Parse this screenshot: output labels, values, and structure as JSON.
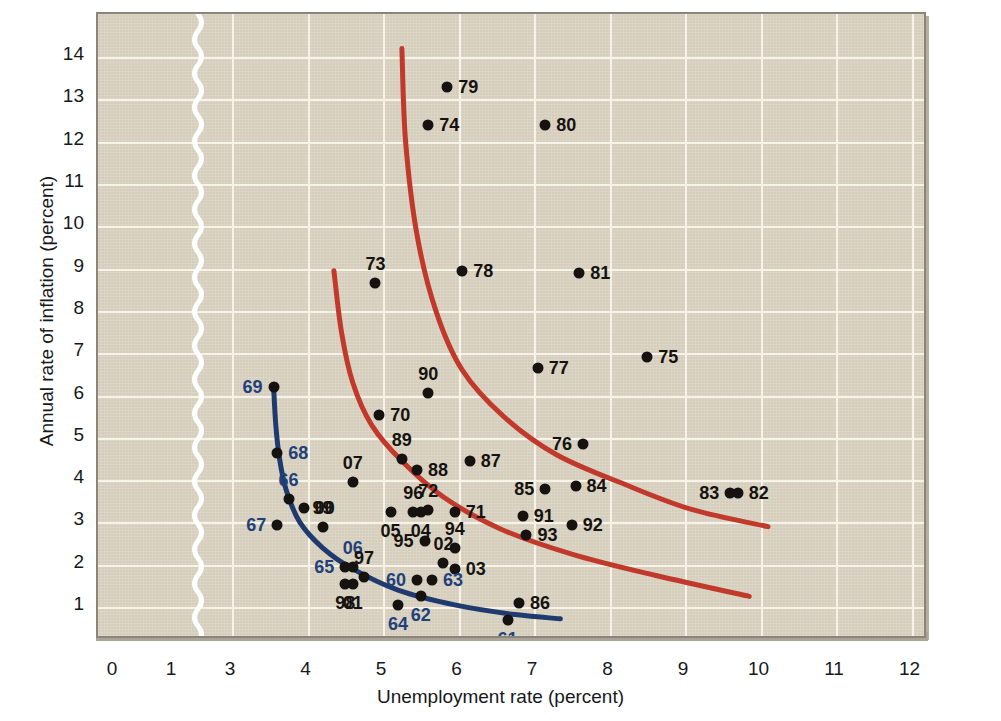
{
  "chart_data": {
    "type": "scatter",
    "title": "",
    "xlabel": "Unemployment rate (percent)",
    "ylabel": "Annual rate of inflation (percent)",
    "xlim": [
      0,
      12.5
    ],
    "ylim": [
      0,
      14.6
    ],
    "x_ticks": [
      "0",
      "1",
      "3",
      "4",
      "5",
      "6",
      "7",
      "8",
      "9",
      "10",
      "11",
      "12"
    ],
    "y_ticks": [
      "1",
      "2",
      "3",
      "4",
      "5",
      "6",
      "7",
      "8",
      "9",
      "10",
      "11",
      "12",
      "13",
      "14"
    ],
    "axis_break": {
      "between": [
        "1",
        "3"
      ],
      "style": "zigzag",
      "color": "#ffffff"
    },
    "grid": true,
    "legend": "none",
    "point_label_format": "two-digit year",
    "points": [
      {
        "label": "79",
        "x": 5.85,
        "y": 13.3,
        "label_pos": "right",
        "label_color": "black"
      },
      {
        "label": "74",
        "x": 5.6,
        "y": 12.4,
        "label_pos": "right",
        "label_color": "black"
      },
      {
        "label": "80",
        "x": 7.15,
        "y": 12.4,
        "label_pos": "right",
        "label_color": "black"
      },
      {
        "label": "73",
        "x": 4.9,
        "y": 8.65,
        "label_pos": "above",
        "label_color": "black"
      },
      {
        "label": "78",
        "x": 6.05,
        "y": 8.95,
        "label_pos": "right",
        "label_color": "black"
      },
      {
        "label": "81",
        "x": 7.6,
        "y": 8.9,
        "label_pos": "right",
        "label_color": "black"
      },
      {
        "label": "77",
        "x": 7.05,
        "y": 6.65,
        "label_pos": "right",
        "label_color": "black"
      },
      {
        "label": "75",
        "x": 8.5,
        "y": 6.9,
        "label_pos": "right",
        "label_color": "black"
      },
      {
        "label": "69",
        "x": 3.55,
        "y": 6.2,
        "label_pos": "left",
        "label_color": "blue"
      },
      {
        "label": "90",
        "x": 5.6,
        "y": 6.05,
        "label_pos": "above",
        "label_color": "black"
      },
      {
        "label": "70",
        "x": 4.95,
        "y": 5.55,
        "label_pos": "right",
        "label_color": "black"
      },
      {
        "label": "68",
        "x": 3.6,
        "y": 4.65,
        "label_pos": "right",
        "label_color": "blue"
      },
      {
        "label": "89",
        "x": 5.25,
        "y": 4.5,
        "label_pos": "above",
        "label_color": "black"
      },
      {
        "label": "76",
        "x": 7.65,
        "y": 4.85,
        "label_pos": "left",
        "label_color": "black"
      },
      {
        "label": "88",
        "x": 5.45,
        "y": 4.25,
        "label_pos": "right",
        "label_color": "black"
      },
      {
        "label": "87",
        "x": 6.15,
        "y": 4.45,
        "label_pos": "right",
        "label_color": "black"
      },
      {
        "label": "07",
        "x": 4.6,
        "y": 3.95,
        "label_pos": "above",
        "label_color": "black"
      },
      {
        "label": "66",
        "x": 3.75,
        "y": 3.55,
        "label_pos": "above",
        "label_color": "blue"
      },
      {
        "label": "85",
        "x": 7.15,
        "y": 3.8,
        "label_pos": "left",
        "label_color": "black"
      },
      {
        "label": "84",
        "x": 7.55,
        "y": 3.85,
        "label_pos": "right",
        "label_color": "black"
      },
      {
        "label": "83",
        "x": 9.6,
        "y": 3.7,
        "label_pos": "left",
        "label_color": "black"
      },
      {
        "label": "82",
        "x": 9.7,
        "y": 3.7,
        "label_pos": "right",
        "label_color": "black"
      },
      {
        "label": "00",
        "x": 3.95,
        "y": 3.35,
        "label_pos": "right",
        "label_color": "black"
      },
      {
        "label": "96",
        "x": 5.4,
        "y": 3.25,
        "label_pos": "above",
        "label_color": "black"
      },
      {
        "label": "72",
        "x": 5.6,
        "y": 3.3,
        "label_pos": "above",
        "label_color": "black"
      },
      {
        "label": "71",
        "x": 5.95,
        "y": 3.25,
        "label_pos": "right",
        "label_color": "black"
      },
      {
        "label": "91",
        "x": 6.85,
        "y": 3.15,
        "label_pos": "right",
        "label_color": "black"
      },
      {
        "label": "92",
        "x": 7.5,
        "y": 2.95,
        "label_pos": "right",
        "label_color": "black"
      },
      {
        "label": "99",
        "x": 4.2,
        "y": 2.9,
        "label_pos": "above",
        "label_color": "black"
      },
      {
        "label": "67",
        "x": 3.6,
        "y": 2.95,
        "label_pos": "left",
        "label_color": "blue"
      },
      {
        "label": "05",
        "x": 5.1,
        "y": 3.25,
        "label_pos": "below",
        "label_color": "black"
      },
      {
        "label": "04",
        "x": 5.5,
        "y": 3.25,
        "label_pos": "below",
        "label_color": "black"
      },
      {
        "label": "93",
        "x": 6.9,
        "y": 2.7,
        "label_pos": "right",
        "label_color": "black"
      },
      {
        "label": "95",
        "x": 5.55,
        "y": 2.55,
        "label_pos": "left",
        "label_color": "black"
      },
      {
        "label": "94",
        "x": 5.95,
        "y": 2.4,
        "label_pos": "above",
        "label_color": "black"
      },
      {
        "label": "02",
        "x": 5.8,
        "y": 2.05,
        "label_pos": "above",
        "label_color": "black"
      },
      {
        "label": "03",
        "x": 5.95,
        "y": 1.9,
        "label_pos": "right",
        "label_color": "black"
      },
      {
        "label": "65",
        "x": 4.5,
        "y": 1.95,
        "label_pos": "left",
        "label_color": "blue"
      },
      {
        "label": "06",
        "x": 4.6,
        "y": 1.95,
        "label_pos": "above",
        "label_color": "blue"
      },
      {
        "label": "97",
        "x": 4.75,
        "y": 1.7,
        "label_pos": "above",
        "label_color": "black"
      },
      {
        "label": "60",
        "x": 5.45,
        "y": 1.65,
        "label_pos": "left",
        "label_color": "blue"
      },
      {
        "label": "63",
        "x": 5.65,
        "y": 1.65,
        "label_pos": "right",
        "label_color": "blue"
      },
      {
        "label": "98",
        "x": 4.5,
        "y": 1.55,
        "label_pos": "below",
        "label_color": "black"
      },
      {
        "label": "01",
        "x": 4.6,
        "y": 1.55,
        "label_pos": "below",
        "label_color": "black"
      },
      {
        "label": "62",
        "x": 5.5,
        "y": 1.25,
        "label_pos": "below",
        "label_color": "blue"
      },
      {
        "label": "64",
        "x": 5.2,
        "y": 1.05,
        "label_pos": "below",
        "label_color": "blue"
      },
      {
        "label": "86",
        "x": 6.8,
        "y": 1.1,
        "label_pos": "right",
        "label_color": "black"
      },
      {
        "label": "61",
        "x": 6.65,
        "y": 0.7,
        "label_pos": "below",
        "label_color": "blue"
      }
    ],
    "curves": [
      {
        "name": "high-expected-inflation-phillips-curve",
        "color": "#c0392b",
        "points": [
          [
            5.25,
            14.2
          ],
          [
            5.3,
            12.0
          ],
          [
            5.45,
            9.8
          ],
          [
            5.7,
            8.0
          ],
          [
            6.05,
            6.6
          ],
          [
            6.6,
            5.5
          ],
          [
            7.3,
            4.6
          ],
          [
            8.2,
            3.9
          ],
          [
            9.1,
            3.3
          ],
          [
            10.1,
            2.9
          ]
        ]
      },
      {
        "name": "mid-expected-inflation-phillips-curve",
        "color": "#c0392b",
        "points": [
          [
            4.35,
            8.95
          ],
          [
            4.45,
            7.5
          ],
          [
            4.6,
            6.3
          ],
          [
            4.85,
            5.3
          ],
          [
            5.25,
            4.45
          ],
          [
            5.8,
            3.6
          ],
          [
            6.55,
            2.85
          ],
          [
            7.5,
            2.25
          ],
          [
            8.6,
            1.75
          ],
          [
            9.85,
            1.25
          ]
        ]
      },
      {
        "name": "low-expected-inflation-phillips-curve",
        "color": "#1f3a6e",
        "points": [
          [
            3.55,
            6.25
          ],
          [
            3.58,
            5.3
          ],
          [
            3.63,
            4.5
          ],
          [
            3.72,
            3.75
          ],
          [
            3.9,
            3.0
          ],
          [
            4.2,
            2.4
          ],
          [
            4.6,
            1.9
          ],
          [
            5.2,
            1.4
          ],
          [
            5.95,
            1.05
          ],
          [
            6.75,
            0.82
          ],
          [
            7.35,
            0.72
          ]
        ]
      }
    ]
  }
}
